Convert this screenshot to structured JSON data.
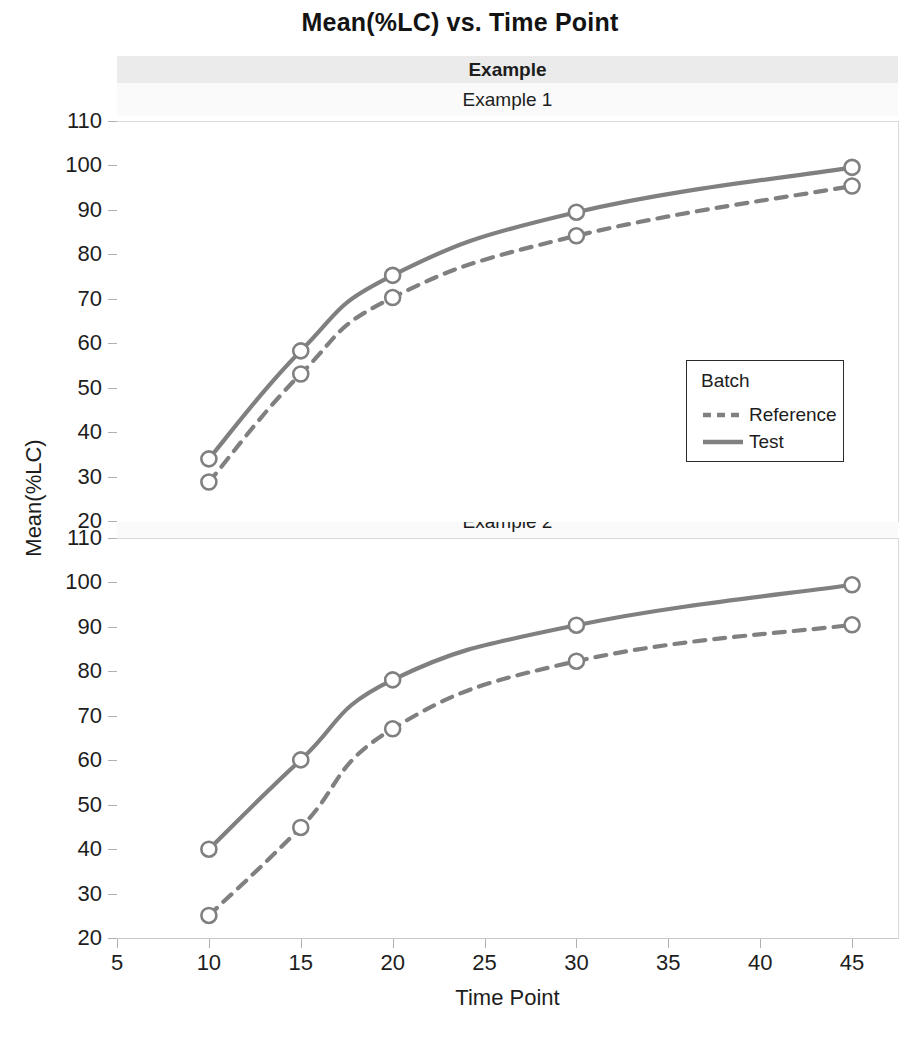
{
  "chart_data": {
    "type": "line",
    "title": "Mean(%LC) vs. Time Point",
    "xlabel": "Time Point",
    "ylabel": "Mean(%LC)",
    "xlim": [
      5,
      47.5
    ],
    "ylim": [
      20,
      110
    ],
    "xticks": [
      5,
      10,
      15,
      20,
      25,
      30,
      35,
      40,
      45
    ],
    "yticks": [
      20,
      30,
      40,
      50,
      60,
      70,
      80,
      90,
      100,
      110
    ],
    "grid": false,
    "legend": {
      "position": "inside-lower-right-panel-1",
      "title": "Batch",
      "entries": [
        {
          "name": "Reference",
          "style": "dashed",
          "color": "#808080"
        },
        {
          "name": "Test",
          "style": "solid",
          "color": "#808080"
        }
      ]
    },
    "facet": {
      "strip_header": "Example",
      "panels": [
        "Example 1",
        "Example 2"
      ]
    },
    "x": [
      10,
      15,
      20,
      30,
      45
    ],
    "panels": [
      {
        "label": "Example 1",
        "series": [
          {
            "name": "Reference",
            "style": "dashed",
            "color": "#808080",
            "values": [
              29.0,
              53.3,
              70.5,
              84.4,
              95.6
            ]
          },
          {
            "name": "Test",
            "style": "solid",
            "color": "#808080",
            "values": [
              34.2,
              58.5,
              75.5,
              89.7,
              99.8
            ]
          }
        ]
      },
      {
        "label": "Example 2",
        "series": [
          {
            "name": "Reference",
            "style": "dashed",
            "color": "#808080",
            "values": [
              25.3,
              45.1,
              67.3,
              82.5,
              90.7
            ]
          },
          {
            "name": "Test",
            "style": "solid",
            "color": "#808080",
            "values": [
              40.2,
              60.3,
              78.3,
              90.6,
              99.7
            ]
          }
        ]
      }
    ],
    "marker": {
      "shape": "open-circle",
      "fill": "#ffffff",
      "stroke": "#808080"
    },
    "colors": {
      "line": "#808080",
      "axis": "#c9c9c9",
      "strip_outer_bg": "#ebebeb",
      "strip_inner_bg": "#fafafa",
      "text": "#1d1d1d"
    }
  }
}
